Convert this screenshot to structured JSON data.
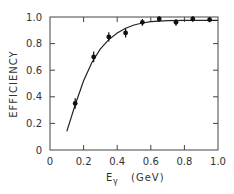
{
  "chart_data": {
    "type": "scatter",
    "title": "",
    "xlabel": "Eγ (GeV)",
    "xlabel_main": "E",
    "xlabel_sub": "γ",
    "xlabel_unit": "(GeV)",
    "ylabel": "EFFICIENCY",
    "xlim": [
      0,
      1.0
    ],
    "ylim": [
      0,
      1.0
    ],
    "x_ticks": [
      "0",
      "0.2",
      "0.4",
      "0.6",
      "0.8",
      "1.0"
    ],
    "y_ticks": [
      "0",
      "0.2",
      "0.4",
      "0.6",
      "0.8",
      "1.0"
    ],
    "grid": false,
    "legend": null,
    "series": [
      {
        "name": "measured efficiency",
        "style": "points with error bars",
        "x": [
          0.15,
          0.26,
          0.35,
          0.45,
          0.55,
          0.65,
          0.75,
          0.85,
          0.95
        ],
        "y": [
          0.35,
          0.7,
          0.85,
          0.88,
          0.96,
          0.985,
          0.96,
          0.985,
          0.98
        ],
        "yerr": [
          0.04,
          0.04,
          0.035,
          0.035,
          0.025,
          0.02,
          0.025,
          0.02,
          0.02
        ]
      },
      {
        "name": "fit curve",
        "style": "line",
        "x": [
          0.1,
          0.15,
          0.2,
          0.25,
          0.3,
          0.35,
          0.4,
          0.45,
          0.5,
          0.55,
          0.6,
          0.7,
          0.8,
          0.9,
          1.0
        ],
        "y": [
          0.14,
          0.34,
          0.52,
          0.66,
          0.76,
          0.83,
          0.88,
          0.915,
          0.94,
          0.955,
          0.965,
          0.972,
          0.975,
          0.975,
          0.975
        ]
      }
    ]
  }
}
